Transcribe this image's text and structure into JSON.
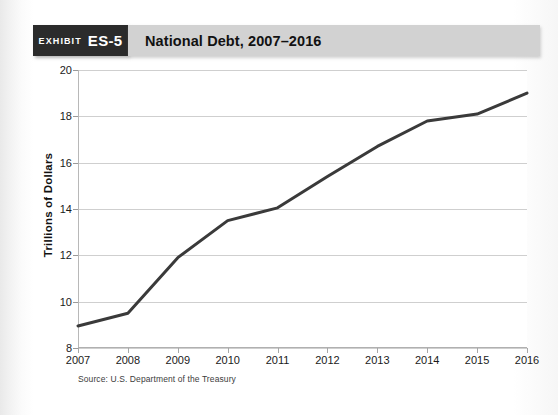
{
  "header": {
    "exhibit_word": "EXHIBIT",
    "exhibit_number": "ES-5",
    "title": "National Debt, 2007–2016",
    "box_color": "#2b2b2b",
    "banner_color": "#d2d2d2"
  },
  "source_note": "Source: U.S. Department of the Treasury",
  "chart_data": {
    "type": "line",
    "title": "National Debt, 2007–2016",
    "xlabel": "",
    "ylabel": "Trillions of Dollars",
    "x": [
      2007,
      2008,
      2009,
      2010,
      2011,
      2012,
      2013,
      2014,
      2015,
      2016
    ],
    "categories": [
      "2007",
      "2008",
      "2009",
      "2010",
      "2011",
      "2012",
      "2013",
      "2014",
      "2015",
      "2016"
    ],
    "values": [
      8.95,
      9.5,
      11.9,
      13.5,
      14.05,
      15.4,
      16.7,
      17.8,
      18.1,
      19.0
    ],
    "series": [
      {
        "name": "National Debt",
        "values": [
          8.95,
          9.5,
          11.9,
          13.5,
          14.05,
          15.4,
          16.7,
          17.8,
          18.1,
          19.0
        ]
      }
    ],
    "xlim": [
      2007,
      2016
    ],
    "ylim": [
      8,
      20
    ],
    "yticks": [
      8,
      10,
      12,
      14,
      16,
      18,
      20
    ],
    "ytick_labels": [
      "8",
      "10",
      "12",
      "14",
      "16",
      "18",
      "20"
    ],
    "xticks": [
      2007,
      2008,
      2009,
      2010,
      2011,
      2012,
      2013,
      2014,
      2015,
      2016
    ],
    "xtick_labels": [
      "2007",
      "2008",
      "2009",
      "2010",
      "2011",
      "2012",
      "2013",
      "2014",
      "2015",
      "2016"
    ],
    "grid": true,
    "grid_axis": "y",
    "grid_color": "#cfcfcf",
    "legend": false,
    "line_color": "#3a3a3a",
    "line_width": 3,
    "markers": false
  }
}
